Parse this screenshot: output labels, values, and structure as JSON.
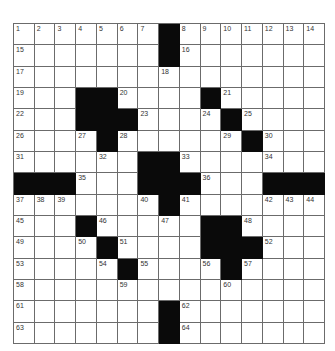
{
  "puzzle": {
    "rows": 15,
    "cols": 15,
    "colors": {
      "black": "#0a0a0a",
      "white": "#ffffff",
      "line": "#6b6b6b",
      "number": "#333333"
    },
    "black_cells": {
      "0": [
        7
      ],
      "1": [
        7
      ],
      "2": [],
      "3": [
        3,
        4,
        9
      ],
      "4": [
        3,
        4,
        5,
        10
      ],
      "5": [
        4,
        11
      ],
      "6": [
        6,
        7
      ],
      "7": [
        0,
        1,
        2,
        6,
        7,
        8,
        12,
        13,
        14
      ],
      "8": [
        7
      ],
      "9": [
        3,
        9,
        10
      ],
      "10": [
        4,
        9,
        10,
        11
      ],
      "11": [
        5,
        10
      ],
      "12": [],
      "13": [
        7
      ],
      "14": [
        7
      ]
    },
    "numbers": [
      {
        "r": 0,
        "c": 0,
        "n": "1"
      },
      {
        "r": 0,
        "c": 1,
        "n": "2"
      },
      {
        "r": 0,
        "c": 2,
        "n": "3"
      },
      {
        "r": 0,
        "c": 3,
        "n": "4"
      },
      {
        "r": 0,
        "c": 4,
        "n": "5"
      },
      {
        "r": 0,
        "c": 5,
        "n": "6"
      },
      {
        "r": 0,
        "c": 6,
        "n": "7"
      },
      {
        "r": 0,
        "c": 8,
        "n": "8"
      },
      {
        "r": 0,
        "c": 9,
        "n": "9"
      },
      {
        "r": 0,
        "c": 10,
        "n": "10"
      },
      {
        "r": 0,
        "c": 11,
        "n": "11"
      },
      {
        "r": 0,
        "c": 12,
        "n": "12"
      },
      {
        "r": 0,
        "c": 13,
        "n": "13"
      },
      {
        "r": 0,
        "c": 14,
        "n": "14"
      },
      {
        "r": 1,
        "c": 0,
        "n": "15"
      },
      {
        "r": 1,
        "c": 8,
        "n": "16"
      },
      {
        "r": 2,
        "c": 0,
        "n": "17"
      },
      {
        "r": 2,
        "c": 7,
        "n": "18"
      },
      {
        "r": 3,
        "c": 0,
        "n": "19"
      },
      {
        "r": 3,
        "c": 5,
        "n": "20"
      },
      {
        "r": 3,
        "c": 10,
        "n": "21"
      },
      {
        "r": 4,
        "c": 0,
        "n": "22"
      },
      {
        "r": 4,
        "c": 6,
        "n": "23"
      },
      {
        "r": 4,
        "c": 9,
        "n": "24"
      },
      {
        "r": 4,
        "c": 11,
        "n": "25"
      },
      {
        "r": 5,
        "c": 0,
        "n": "26"
      },
      {
        "r": 5,
        "c": 3,
        "n": "27"
      },
      {
        "r": 5,
        "c": 5,
        "n": "28"
      },
      {
        "r": 5,
        "c": 10,
        "n": "29"
      },
      {
        "r": 5,
        "c": 12,
        "n": "30"
      },
      {
        "r": 6,
        "c": 0,
        "n": "31"
      },
      {
        "r": 6,
        "c": 4,
        "n": "32"
      },
      {
        "r": 6,
        "c": 8,
        "n": "33"
      },
      {
        "r": 6,
        "c": 12,
        "n": "34"
      },
      {
        "r": 7,
        "c": 3,
        "n": "35"
      },
      {
        "r": 7,
        "c": 9,
        "n": "36"
      },
      {
        "r": 8,
        "c": 0,
        "n": "37"
      },
      {
        "r": 8,
        "c": 1,
        "n": "38"
      },
      {
        "r": 8,
        "c": 2,
        "n": "39"
      },
      {
        "r": 8,
        "c": 6,
        "n": "40"
      },
      {
        "r": 8,
        "c": 8,
        "n": "41"
      },
      {
        "r": 8,
        "c": 12,
        "n": "42"
      },
      {
        "r": 8,
        "c": 13,
        "n": "43"
      },
      {
        "r": 8,
        "c": 14,
        "n": "44"
      },
      {
        "r": 9,
        "c": 0,
        "n": "45"
      },
      {
        "r": 9,
        "c": 4,
        "n": "46"
      },
      {
        "r": 9,
        "c": 7,
        "n": "47"
      },
      {
        "r": 9,
        "c": 11,
        "n": "48"
      },
      {
        "r": 10,
        "c": 0,
        "n": "49"
      },
      {
        "r": 10,
        "c": 3,
        "n": "50"
      },
      {
        "r": 10,
        "c": 5,
        "n": "51"
      },
      {
        "r": 10,
        "c": 12,
        "n": "52"
      },
      {
        "r": 11,
        "c": 0,
        "n": "53"
      },
      {
        "r": 11,
        "c": 4,
        "n": "54"
      },
      {
        "r": 11,
        "c": 6,
        "n": "55"
      },
      {
        "r": 11,
        "c": 9,
        "n": "56"
      },
      {
        "r": 11,
        "c": 11,
        "n": "57"
      },
      {
        "r": 12,
        "c": 0,
        "n": "58"
      },
      {
        "r": 12,
        "c": 5,
        "n": "59"
      },
      {
        "r": 12,
        "c": 10,
        "n": "60"
      },
      {
        "r": 13,
        "c": 0,
        "n": "61"
      },
      {
        "r": 13,
        "c": 8,
        "n": "62"
      },
      {
        "r": 14,
        "c": 0,
        "n": "63"
      },
      {
        "r": 14,
        "c": 8,
        "n": "64"
      }
    ]
  }
}
